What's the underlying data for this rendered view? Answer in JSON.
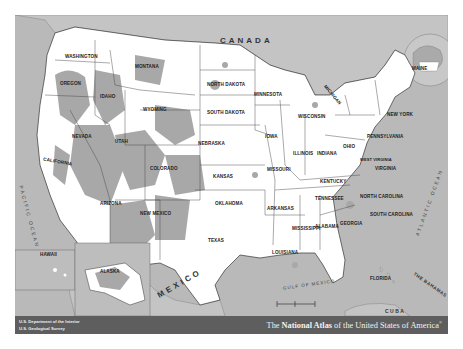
{
  "map": {
    "title_prefix": "The ",
    "title_bold": "National Atlas",
    "title_suffix": " of the United States of America",
    "title_mark": "®",
    "agency_line1": "U.S. Department of the Interior",
    "agency_line2": "U.S. Geological Survey",
    "colors": {
      "water": "#b9b9b9",
      "land_us": "#ffffff",
      "federal_land": "#a8a8a8",
      "foreign_land": "#c4c4c4",
      "border": "#333333",
      "banner": "#5e5e5e"
    },
    "countries": [
      "CANADA",
      "MEXICO",
      "CUBA",
      "THE BAHAMAS"
    ],
    "water_bodies": [
      "PACIFIC OCEAN",
      "ATLANTIC OCEAN",
      "GULF OF MEXICO",
      "PACIFIC OCEAN",
      "ARCTIC OCEAN"
    ],
    "states": [
      "WASHINGTON",
      "OREGON",
      "CALIFORNIA",
      "IDAHO",
      "NEVADA",
      "MONTANA",
      "WYOMING",
      "UTAH",
      "ARIZONA",
      "COLORADO",
      "NEW MEXICO",
      "NORTH DAKOTA",
      "SOUTH DAKOTA",
      "NEBRASKA",
      "KANSAS",
      "OKLAHOMA",
      "TEXAS",
      "MINNESOTA",
      "IOWA",
      "MISSOURI",
      "ARKANSAS",
      "LOUISIANA",
      "WISCONSIN",
      "ILLINOIS",
      "MICHIGAN",
      "INDIANA",
      "OHIO",
      "KENTUCKY",
      "TENNESSEE",
      "MISSISSIPPI",
      "ALABAMA",
      "GEORGIA",
      "FLORIDA",
      "SOUTH CAROLINA",
      "NORTH CAROLINA",
      "VIRGINIA",
      "WEST VIRGINIA",
      "PENNSYLVANIA",
      "NEW YORK",
      "MAINE",
      "VERMONT",
      "NEW HAMPSHIRE",
      "MASSACHUSETTS",
      "RHODE ISLAND",
      "CONNECTICUT",
      "NEW JERSEY",
      "DELAWARE",
      "MARYLAND",
      "HAWAII",
      "ALASKA"
    ],
    "labels": {
      "canada": "CANADA",
      "mexico": "MEXICO",
      "cuba": "CUBA",
      "bahamas": "THE BAHAMAS",
      "pacific": "PACIFIC OCEAN",
      "atlantic": "ATLANTIC OCEAN",
      "gulf": "GULF OF MEXICO",
      "washington": "WASHINGTON",
      "oregon": "OREGON",
      "california": "CALIFORNIA",
      "idaho": "IDAHO",
      "nevada": "NEVADA",
      "montana": "MONTANA",
      "wyoming": "WYOMING",
      "utah": "UTAH",
      "arizona": "ARIZONA",
      "colorado": "COLORADO",
      "new_mexico": "NEW MEXICO",
      "north_dakota": "NORTH DAKOTA",
      "south_dakota": "SOUTH DAKOTA",
      "nebraska": "NEBRASKA",
      "kansas": "KANSAS",
      "oklahoma": "OKLAHOMA",
      "texas": "TEXAS",
      "minnesota": "MINNESOTA",
      "iowa": "IOWA",
      "missouri": "MISSOURI",
      "arkansas": "ARKANSAS",
      "louisiana": "LOUISIANA",
      "wisconsin": "WISCONSIN",
      "illinois": "ILLINOIS",
      "michigan": "MICHIGAN",
      "indiana": "INDIANA",
      "ohio": "OHIO",
      "kentucky": "KENTUCKY",
      "tennessee": "TENNESSEE",
      "mississippi": "MISSISSIPPI",
      "alabama": "ALABAMA",
      "georgia": "GEORGIA",
      "florida": "FLORIDA",
      "south_carolina": "SOUTH CAROLINA",
      "north_carolina": "NORTH CAROLINA",
      "virginia": "VIRGINIA",
      "west_virginia": "WEST VIRGINIA",
      "pennsylvania": "PENNSYLVANIA",
      "new_york": "NEW YORK",
      "maine": "MAINE",
      "hawaii": "HAWAII",
      "alaska": "ALASKA"
    }
  }
}
